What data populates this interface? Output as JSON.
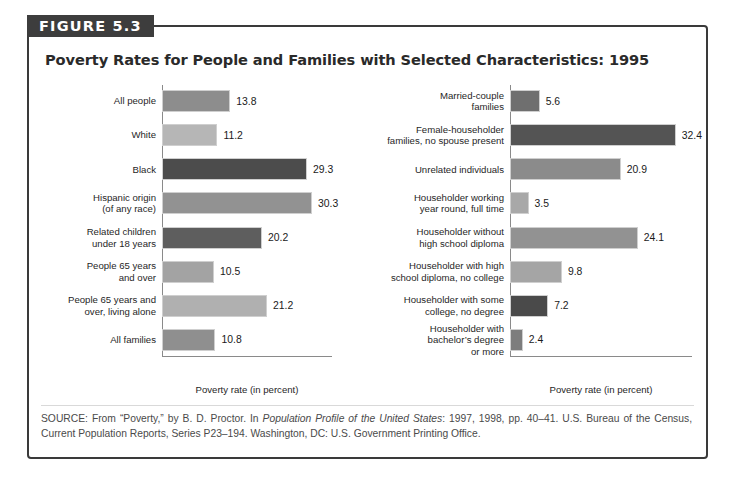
{
  "figure": {
    "badge_label": "FIGURE 5.3",
    "title": "Poverty Rates for People and Families with Selected Characteristics: 1995",
    "border_color": "#3a3a3a",
    "badge_bg": "#3d3d3d",
    "badge_fg": "#ffffff"
  },
  "source": {
    "prefix": "SOURCE: From “Poverty,” by B. D. Proctor. In ",
    "italic_title": "Population Profile of the United States",
    "suffix": ": 1997, 1998, pp. 40–41. U.S. Bureau of the Census, Current Population Reports, Series P23–194. Washington, DC: U.S. Government Printing Office."
  },
  "chart_data": [
    {
      "type": "bar",
      "orientation": "horizontal",
      "title": "Poverty Rates for People and Families with Selected Characteristics: 1995",
      "panel": "left",
      "xlabel": "Poverty rate (in percent)",
      "ylabel": "",
      "xlim": [
        0,
        33
      ],
      "grid": false,
      "legend": "none",
      "categories": [
        "All people",
        "White",
        "Black",
        "Hispanic origin\n(of any race)",
        "Related children\nunder 18 years",
        "People 65 years\nand over",
        "People 65 years and\nover, living alone",
        "All families"
      ],
      "values": [
        13.8,
        11.2,
        29.3,
        30.3,
        20.2,
        10.5,
        21.2,
        10.8
      ],
      "value_labels": [
        "13.8",
        "11.2",
        "29.3",
        "30.3",
        "20.2",
        "10.5",
        "21.2",
        "10.8"
      ],
      "bar_colors": [
        "#8d8d8d",
        "#b6b6b6",
        "#4c4c4c",
        "#929292",
        "#5e5e5e",
        "#a3a3a3",
        "#b0b0b0",
        "#8f8f8f"
      ]
    },
    {
      "type": "bar",
      "orientation": "horizontal",
      "panel": "right",
      "xlabel": "Poverty rate (in percent)",
      "ylabel": "",
      "xlim": [
        0,
        33
      ],
      "grid": false,
      "legend": "none",
      "categories": [
        "Married-couple\nfamilies",
        "Female-householder\nfamilies, no spouse present",
        "Unrelated individuals",
        "Householder working\nyear round, full time",
        "Householder without\nhigh school diploma",
        "Householder with high\nschool diploma, no college",
        "Householder with some\ncollege, no degree",
        "Householder with\nbachelor’s degree\nor more"
      ],
      "values": [
        5.6,
        32.4,
        20.9,
        3.5,
        24.1,
        9.8,
        7.2,
        2.4
      ],
      "value_labels": [
        "5.6",
        "32.4",
        "20.9",
        "3.5",
        "24.1",
        "9.8",
        "7.2",
        "2.4"
      ],
      "bar_colors": [
        "#6f6f6f",
        "#545454",
        "#8b8b8b",
        "#a8a8a8",
        "#929292",
        "#a5a5a5",
        "#4a4a4a",
        "#7d7d7d"
      ]
    }
  ]
}
